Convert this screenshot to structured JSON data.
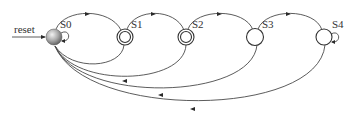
{
  "diagram": {
    "type": "state-machine",
    "input_label": "reset",
    "states": [
      {
        "id": "S0",
        "label": "S0",
        "initial": true,
        "accepting": false,
        "self_loop": true,
        "x": 54,
        "y": 37
      },
      {
        "id": "S1",
        "label": "S1",
        "initial": false,
        "accepting": true,
        "self_loop": false,
        "x": 125,
        "y": 37
      },
      {
        "id": "S2",
        "label": "S2",
        "initial": false,
        "accepting": true,
        "self_loop": false,
        "x": 186,
        "y": 37
      },
      {
        "id": "S3",
        "label": "S3",
        "initial": false,
        "accepting": false,
        "self_loop": false,
        "x": 255,
        "y": 37
      },
      {
        "id": "S4",
        "label": "S4",
        "initial": false,
        "accepting": false,
        "self_loop": true,
        "x": 324,
        "y": 37
      }
    ],
    "transitions": [
      {
        "from": "reset",
        "to": "S0"
      },
      {
        "from": "S0",
        "to": "S0"
      },
      {
        "from": "S0",
        "to": "S1"
      },
      {
        "from": "S1",
        "to": "S2"
      },
      {
        "from": "S2",
        "to": "S3"
      },
      {
        "from": "S3",
        "to": "S4"
      },
      {
        "from": "S4",
        "to": "S4"
      },
      {
        "from": "S1",
        "to": "S0"
      },
      {
        "from": "S2",
        "to": "S0"
      },
      {
        "from": "S3",
        "to": "S0"
      },
      {
        "from": "S4",
        "to": "S0"
      }
    ]
  }
}
